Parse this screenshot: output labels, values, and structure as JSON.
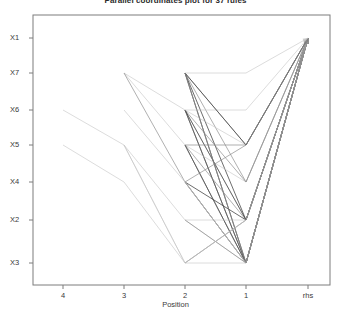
{
  "title": "Parallel coordinates plot for 37 rules",
  "axes": {
    "x_label": "Position",
    "x_ticks": [
      {
        "label": "4",
        "px": 63
      },
      {
        "label": "3",
        "px": 124
      },
      {
        "label": "2",
        "px": 185
      },
      {
        "label": "1",
        "px": 246
      },
      {
        "label": "rhs",
        "px": 308
      }
    ],
    "y_ticks": [
      {
        "label": "X1",
        "px": 38
      },
      {
        "label": "X7",
        "px": 73
      },
      {
        "label": "X6",
        "px": 110
      },
      {
        "label": "X5",
        "px": 145
      },
      {
        "label": "X4",
        "px": 182
      },
      {
        "label": "X2",
        "px": 220
      },
      {
        "label": "X3",
        "px": 263
      }
    ]
  },
  "colors": {
    "line_dark": "#4a4a4a",
    "line_mid": "#8a8a8a",
    "line_light": "#c4c4c4",
    "frame": "#7d7d7d",
    "text": "#3a3a3a",
    "background": "#ffffff"
  },
  "chart_data": {
    "type": "line",
    "title": "Parallel coordinates plot for 37 rules",
    "xlabel": "Position",
    "ylabel": "",
    "grid": false,
    "legend": false,
    "x_categories": [
      "4",
      "3",
      "2",
      "1",
      "rhs"
    ],
    "y_categories": [
      "X1",
      "X7",
      "X6",
      "X5",
      "X4",
      "X2",
      "X3"
    ],
    "note": "Parallel coordinates plot of association rules; each polyline is one rule, arrowhead terminates at the rhs axis. Line darkness encodes rule support/lift.",
    "series": [
      {
        "name": "rule-1",
        "shade": "light",
        "points": [
          null,
          null,
          null,
          "X2",
          "X1"
        ]
      },
      {
        "name": "rule-2",
        "shade": "light",
        "points": [
          null,
          null,
          null,
          "X3",
          "X1"
        ]
      },
      {
        "name": "rule-3",
        "shade": "light",
        "points": [
          null,
          null,
          "X7",
          "X3",
          "X1"
        ]
      },
      {
        "name": "rule-4",
        "shade": "light",
        "points": [
          null,
          null,
          "X6",
          "X2",
          "X1"
        ]
      },
      {
        "name": "rule-5",
        "shade": "mid",
        "points": [
          null,
          null,
          "X7",
          "X5",
          "X1"
        ]
      },
      {
        "name": "rule-6",
        "shade": "mid",
        "points": [
          null,
          null,
          "X6",
          "X3",
          "X1"
        ]
      },
      {
        "name": "rule-7",
        "shade": "dark",
        "points": [
          null,
          null,
          "X7",
          "X3",
          "X1"
        ]
      },
      {
        "name": "rule-8",
        "shade": "dark",
        "points": [
          null,
          null,
          "X7",
          "X2",
          "X1"
        ]
      },
      {
        "name": "rule-9",
        "shade": "mid",
        "points": [
          null,
          null,
          "X5",
          "X3",
          "X1"
        ]
      },
      {
        "name": "rule-10",
        "shade": "mid",
        "points": [
          null,
          null,
          "X4",
          "X3",
          "X1"
        ]
      },
      {
        "name": "rule-11",
        "shade": "light",
        "points": [
          null,
          "X7",
          "X6",
          "X3",
          "X1"
        ]
      },
      {
        "name": "rule-12",
        "shade": "light",
        "points": [
          null,
          "X5",
          "X2",
          "X3",
          "X1"
        ]
      },
      {
        "name": "rule-13",
        "shade": "light",
        "points": [
          null,
          "X7",
          "X5",
          "X3",
          "X1"
        ]
      },
      {
        "name": "rule-14",
        "shade": "mid",
        "points": [
          null,
          "X7",
          "X4",
          "X3",
          "X1"
        ]
      },
      {
        "name": "rule-15",
        "shade": "light",
        "points": [
          "X6",
          "X5",
          "X3",
          "X3",
          "X1"
        ]
      },
      {
        "name": "rule-16",
        "shade": "light",
        "points": [
          "X5",
          "X4",
          "X3",
          "X2",
          "X1"
        ]
      },
      {
        "name": "rule-17",
        "shade": "mid",
        "points": [
          null,
          null,
          "X6",
          "X4",
          "X1"
        ]
      },
      {
        "name": "rule-18",
        "shade": "dark",
        "points": [
          null,
          null,
          "X6",
          "X3",
          "X1"
        ]
      },
      {
        "name": "rule-19",
        "shade": "mid",
        "points": [
          null,
          null,
          "X5",
          "X2",
          "X1"
        ]
      },
      {
        "name": "rule-20",
        "shade": "dark",
        "points": [
          null,
          null,
          "X4",
          "X2",
          "X1"
        ]
      },
      {
        "name": "rule-21",
        "shade": "mid",
        "points": [
          null,
          null,
          "X2",
          "X3",
          "X1"
        ]
      },
      {
        "name": "rule-22",
        "shade": "light",
        "points": [
          null,
          null,
          "X5",
          "X4",
          "X1"
        ]
      },
      {
        "name": "rule-23",
        "shade": "mid",
        "points": [
          null,
          null,
          "X7",
          "X4",
          "X1"
        ]
      },
      {
        "name": "rule-24",
        "shade": "light",
        "points": [
          null,
          null,
          "X6",
          "X5",
          "X1"
        ]
      },
      {
        "name": "rule-25",
        "shade": "dark",
        "points": [
          null,
          null,
          "X5",
          "X3",
          "X1"
        ]
      },
      {
        "name": "rule-26",
        "shade": "mid",
        "points": [
          null,
          null,
          "X4",
          "X3",
          "X1"
        ]
      },
      {
        "name": "rule-27",
        "shade": "light",
        "points": [
          null,
          "X6",
          "X4",
          "X3",
          "X1"
        ]
      },
      {
        "name": "rule-28",
        "shade": "mid",
        "points": [
          null,
          null,
          "X3",
          "X2",
          "X1"
        ]
      },
      {
        "name": "rule-29",
        "shade": "light",
        "points": [
          null,
          null,
          "X2",
          "X2",
          "X1"
        ]
      },
      {
        "name": "rule-30",
        "shade": "dark",
        "points": [
          null,
          null,
          "X6",
          "X2",
          "X1"
        ]
      },
      {
        "name": "rule-31",
        "shade": "mid",
        "points": [
          null,
          null,
          "X7",
          "X3",
          "X1"
        ]
      },
      {
        "name": "rule-32",
        "shade": "light",
        "points": [
          null,
          "X5",
          "X3",
          "X2",
          "X1"
        ]
      },
      {
        "name": "rule-33",
        "shade": "mid",
        "points": [
          null,
          null,
          "X4",
          "X5",
          "X1"
        ]
      },
      {
        "name": "rule-34",
        "shade": "light",
        "points": [
          null,
          null,
          "X6",
          "X6",
          "X1"
        ]
      },
      {
        "name": "rule-35",
        "shade": "dark",
        "points": [
          null,
          null,
          "X7",
          "X5",
          "X1"
        ]
      },
      {
        "name": "rule-36",
        "shade": "mid",
        "points": [
          null,
          null,
          "X5",
          "X5",
          "X1"
        ]
      },
      {
        "name": "rule-37",
        "shade": "light",
        "points": [
          null,
          null,
          "X7",
          "X7",
          "X1"
        ]
      }
    ]
  }
}
